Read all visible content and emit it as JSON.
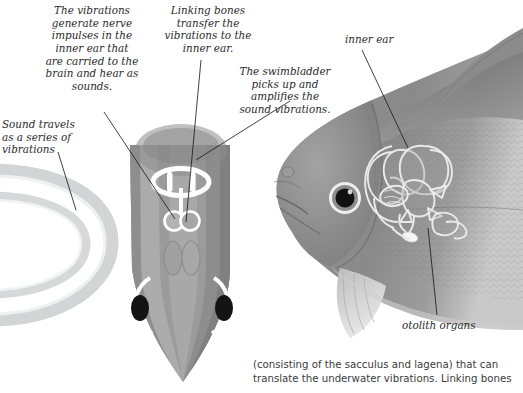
{
  "figure": {
    "title_semantic": "how-fish-hear-diagram",
    "background_color": "#ffffff",
    "text_color": "#2b2b2b"
  },
  "annotations": {
    "vibrations_nerve": "The vibrations\ngenerate nerve\nimpulses in the\ninner ear that\nare carried to the\nbrain and hear as\nsounds.",
    "linking_bones": "Linking bones\ntransfer the\nvibrations to the\ninner ear.",
    "swimbladder": "The swimbladder\npicks up and\namplifies the\nsound vibrations.",
    "sound_travels": "Sound travels\nas a series of\nvibrations",
    "inner_ear": "inner ear",
    "otolith_organs": "otolith organs"
  },
  "caption": {
    "text": "(consisting of the sacculus and lagena) that can\ntranslate the underwater vibrations. Linking bones"
  },
  "colors": {
    "sound_wave_band": "#d3d5d6",
    "sound_wave_highlight": "#eceded",
    "fish_head_mid": "#9a9a9a",
    "fish_head_light": "#b4b4b4",
    "fish_head_dark": "#8a8a8a",
    "fish_head_darkest": "#7e7e7e",
    "swimbladder_outline": "#ffffff",
    "linking_bone_fill": "#b0b0b0",
    "eye_pupil": "#151515",
    "eye_highlight": "#ffffff",
    "photo_body": "#8e8e8e",
    "labyrinth_outline": "#e8e8e8",
    "leader_line": "#1f1f1f"
  },
  "elements": {
    "sound_waves_label": "sound-wave-arcs",
    "fish_head_topview_label": "fish-head-top-view",
    "swimbladder_label": "swimbladder-shape",
    "linking_bones_label": "linking-bones-pair",
    "nostrils_label": "nostril-pair",
    "left_eye_label": "fish-eye-left",
    "right_eye_label": "fish-eye-right",
    "photo_label": "fish-side-photograph",
    "inner_ear_overlay_label": "inner-ear-labyrinth-overlay",
    "otolith_label": "otolith-highlight"
  },
  "leader_lines": [
    {
      "name": "leader-vibrations-nerve",
      "from": [
        104,
        112
      ],
      "to": [
        175,
        219
      ]
    },
    {
      "name": "leader-linking-bones",
      "from": [
        201,
        60
      ],
      "to": [
        186,
        222
      ]
    },
    {
      "name": "leader-swimbladder",
      "from": [
        290,
        101
      ],
      "to": [
        196,
        160
      ]
    },
    {
      "name": "leader-sound-travels",
      "from": [
        58,
        152
      ],
      "to": [
        76,
        210
      ]
    },
    {
      "name": "leader-inner-ear",
      "from": [
        362,
        50
      ],
      "to": [
        408,
        148
      ]
    },
    {
      "name": "leader-otolith",
      "from": [
        437,
        315
      ],
      "to": [
        428,
        228
      ]
    }
  ]
}
